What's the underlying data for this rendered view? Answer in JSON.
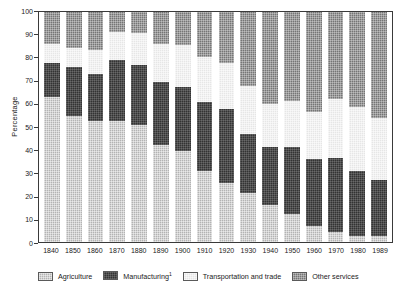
{
  "chart_data": {
    "type": "bar",
    "subtype": "stacked-100-percent",
    "title": "",
    "xlabel": "",
    "ylabel": "Percentage",
    "ylim": [
      0,
      100
    ],
    "yticks": [
      0,
      10,
      20,
      30,
      40,
      50,
      60,
      70,
      80,
      90,
      100
    ],
    "grid": false,
    "legend_position": "bottom",
    "categories": [
      "1840",
      "1850",
      "1860",
      "1870",
      "1880",
      "1890",
      "1900",
      "1910",
      "1920",
      "1930",
      "1940",
      "1950",
      "1960",
      "1970",
      "1980",
      "1989"
    ],
    "series": [
      {
        "name": "Agriculture",
        "color": "#b3b3b3",
        "values": [
          63,
          55,
          52.5,
          52.5,
          51,
          42,
          39.5,
          31,
          25.5,
          21.5,
          16,
          12,
          7,
          4.5,
          2.5,
          2.5
        ]
      },
      {
        "name": "Manufacturing",
        "color": "#333333",
        "values": [
          15,
          21,
          20.5,
          26.5,
          26,
          27.5,
          28,
          30,
          32.5,
          25.5,
          25.5,
          29.5,
          29,
          32,
          28.5,
          24.5
        ]
      },
      {
        "name": "Transportation and trade",
        "color": "#e6e6e6",
        "values": [
          8,
          8.5,
          10.5,
          12.5,
          14,
          16.5,
          18,
          19.5,
          20,
          21,
          18.5,
          20,
          20.5,
          25.5,
          27.5,
          27
        ]
      },
      {
        "name": "Other services",
        "color": "#757575",
        "values": [
          14,
          15.5,
          16.5,
          8.5,
          9,
          14,
          14.5,
          19.5,
          22,
          32,
          40,
          38.5,
          43.5,
          38,
          41.5,
          46
        ]
      }
    ],
    "footnote_marker": "1"
  },
  "legend": {
    "items": [
      {
        "label": "Agriculture",
        "swatch": "fill-agri",
        "sup": ""
      },
      {
        "label": "Manufacturing",
        "swatch": "fill-mfg",
        "sup": "1"
      },
      {
        "label": "Transportation and trade",
        "swatch": "fill-trans",
        "sup": ""
      },
      {
        "label": "Other services",
        "swatch": "fill-other",
        "sup": ""
      }
    ]
  },
  "axis": {
    "y_label": "Percentage",
    "y_tick_labels": [
      "100",
      "90",
      "80",
      "70",
      "60",
      "50",
      "40",
      "30",
      "20",
      "10",
      "0"
    ]
  }
}
